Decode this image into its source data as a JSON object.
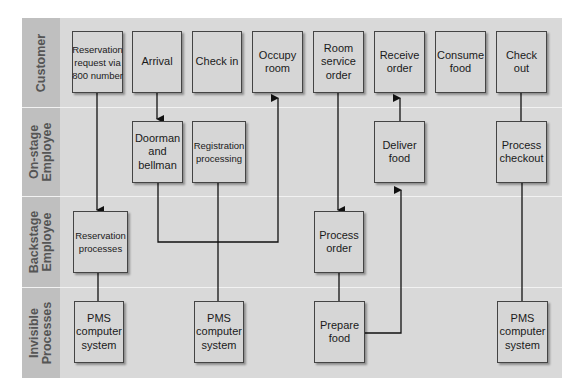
{
  "diagram": {
    "type": "service blueprint",
    "lanes": [
      {
        "label": "Customer"
      },
      {
        "label": "On-stage Employee",
        "line1": "On-stage",
        "line2": "Employee"
      },
      {
        "label": "Backstage Employee",
        "line1": "Backstage",
        "line2": "Employee"
      },
      {
        "label": "Invisible Processes",
        "line1": "Invisible",
        "line2": "Processes"
      }
    ],
    "customer": [
      "Reservation request via 800 number",
      "Arrival",
      "Check in",
      "Occupy room",
      "Room service order",
      "Receive order",
      "Consume food",
      "Check out"
    ],
    "onstage": [
      "Doorman and bellman",
      "Registration processing",
      "Deliver food",
      "Process checkout"
    ],
    "backstage": [
      "Reservation processes",
      "Process order"
    ],
    "invisible": [
      "PMS computer system",
      "PMS computer system",
      "Prepare food",
      "PMS computer system"
    ],
    "connections": [
      {
        "from": "Reservation request via 800 number",
        "to": "Reservation processes",
        "arrow": true
      },
      {
        "from": "Reservation processes",
        "to": "PMS computer system",
        "arrow": false
      },
      {
        "from": "Arrival",
        "to": "Doorman and bellman",
        "arrow": true
      },
      {
        "from": "Doorman and bellman",
        "to": "Occupy room",
        "arrow": true
      },
      {
        "from": "Registration processing",
        "to": "PMS computer system",
        "arrow": false
      },
      {
        "from": "Room service order",
        "to": "Process order",
        "arrow": true
      },
      {
        "from": "Process order",
        "to": "Prepare food",
        "arrow": false
      },
      {
        "from": "Prepare food",
        "to": "Deliver food",
        "arrow": true
      },
      {
        "from": "Deliver food",
        "to": "Receive order",
        "arrow": true
      },
      {
        "from": "Check out",
        "to": "Process checkout",
        "arrow": false
      },
      {
        "from": "Process checkout",
        "to": "PMS computer system",
        "arrow": false
      }
    ]
  }
}
